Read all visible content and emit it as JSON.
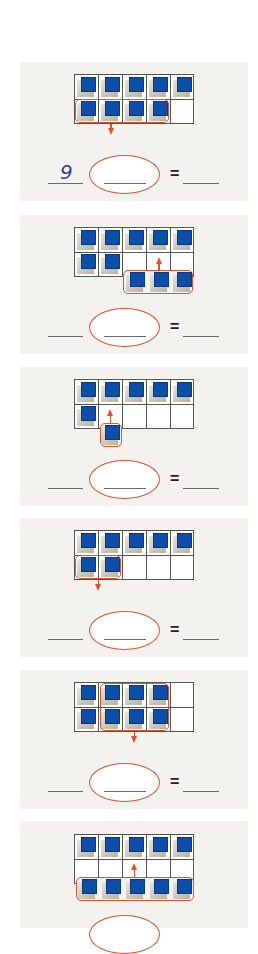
{
  "worksheet": {
    "type": "ten-frame subtraction exercises",
    "colors": {
      "panel_background": "#f3f2ef",
      "cube_blue": "#0d4fa8",
      "highlight_red": "#e2512b",
      "answer_ink": "#2b3f8c"
    },
    "equals_sign": "=",
    "problems": [
      {
        "id": 1,
        "cubes_in_frame": 9,
        "removed": 4,
        "direction": "down",
        "first_blank": "9",
        "middle_blank": "",
        "result_blank": ""
      },
      {
        "id": 2,
        "cubes_in_frame": 7,
        "added": 3,
        "direction": "up",
        "first_blank": "",
        "middle_blank": "",
        "result_blank": ""
      },
      {
        "id": 3,
        "cubes_in_frame": 6,
        "added": 1,
        "direction": "up",
        "first_blank": "",
        "middle_blank": "",
        "result_blank": ""
      },
      {
        "id": 4,
        "cubes_in_frame": 7,
        "removed": 2,
        "direction": "down",
        "first_blank": "",
        "middle_blank": "",
        "result_blank": ""
      },
      {
        "id": 5,
        "cubes_in_frame": 8,
        "removed": 6,
        "direction": "down",
        "first_blank": "",
        "middle_blank": "",
        "result_blank": ""
      },
      {
        "id": 6,
        "cubes_in_frame": 5,
        "added": 5,
        "direction": "up",
        "first_blank": "",
        "middle_blank": "",
        "result_blank": ""
      }
    ]
  }
}
